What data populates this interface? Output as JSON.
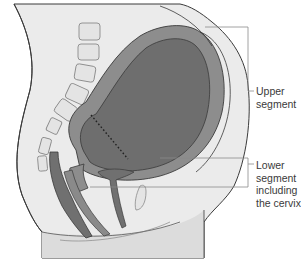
{
  "figure": {
    "colors": {
      "background": "#ffffff",
      "body_fill": "#ebebeb",
      "vertebra_fill": "#e2e2e2",
      "uterine_wall": "#8d8d8d",
      "uterine_cavity": "#6e6e6e",
      "outline": "#3a3a3a",
      "rectum": "#707070",
      "label_text": "#3a3a3a",
      "leader_line": "#8a8a8a"
    }
  },
  "labels": {
    "upper": "Upper\nsegment",
    "lower": "Lower\nsegment\nincluding\nthe cervix"
  }
}
